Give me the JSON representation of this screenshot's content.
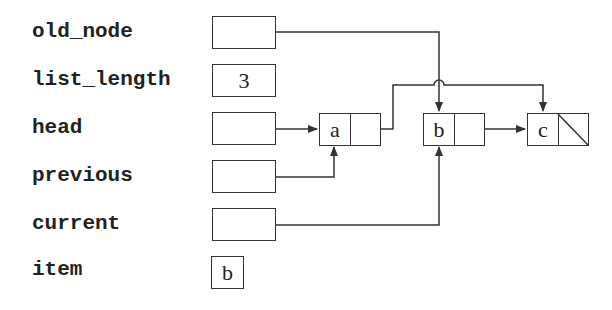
{
  "variables": [
    {
      "name": "old_node",
      "value": ""
    },
    {
      "name": "list_length",
      "value": "3"
    },
    {
      "name": "head",
      "value": ""
    },
    {
      "name": "previous",
      "value": ""
    },
    {
      "name": "current",
      "value": ""
    },
    {
      "name": "item",
      "value": "b"
    }
  ],
  "nodes": [
    {
      "data": "a",
      "next": "b"
    },
    {
      "data": "b",
      "next": "c"
    },
    {
      "data": "c",
      "next": "null"
    }
  ],
  "pointers": [
    {
      "from": "old_node",
      "to": "b"
    },
    {
      "from": "head",
      "to": "a"
    },
    {
      "from": "previous",
      "to": "a"
    },
    {
      "from": "current",
      "to": "b"
    },
    {
      "from": "a.next",
      "to": "c"
    },
    {
      "from": "b.next",
      "to": "c"
    }
  ],
  "colors": {
    "line": "#333333",
    "text": "#222222",
    "background": "#ffffff"
  }
}
